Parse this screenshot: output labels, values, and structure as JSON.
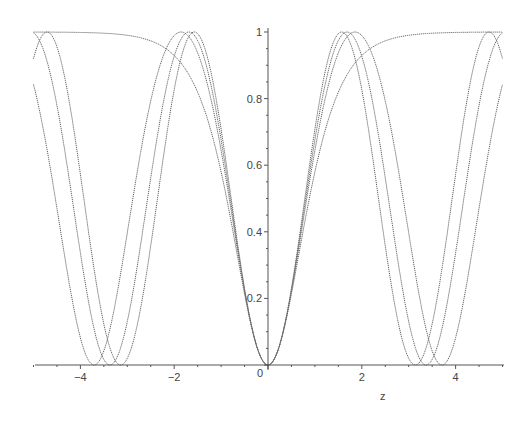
{
  "chart_data": {
    "type": "line",
    "title": "",
    "xlabel": "z",
    "ylabel": "",
    "xlim": [
      -5,
      5
    ],
    "ylim": [
      0,
      1
    ],
    "grid": false,
    "legend": null,
    "x_ticks": [
      -4,
      -2,
      0,
      2,
      4
    ],
    "x_tick_labels": [
      "-4",
      "-2",
      "0",
      "2",
      "4"
    ],
    "y_ticks": [
      0.2,
      0.4,
      0.6,
      0.8,
      1
    ],
    "y_tick_labels": [
      "0.2",
      "0.4",
      "0.6",
      "0.8",
      "1"
    ],
    "origin_label": "0",
    "line_color": "#666666",
    "line_style": "dotted",
    "series": [
      {
        "name": "sn^2(z, k=0) = sin^2(z)",
        "k": 0,
        "peak_z": 1.571,
        "zero_z": 3.142
      },
      {
        "name": "sn^2(z, k=0.5)",
        "k": 0.5,
        "peak_z": 1.686,
        "zero_z": 3.371
      },
      {
        "name": "sn^2(z, k=0.7071)",
        "k": 0.7071,
        "peak_z": 1.854,
        "zero_z": 3.708
      },
      {
        "name": "sn^2(z, k=1) = tanh^2(z)",
        "k": 1,
        "peak_z": null,
        "zero_z": 0
      }
    ],
    "sample_points": {
      "x": [
        -5,
        -4,
        -3,
        -2,
        -1,
        0,
        1,
        2,
        3,
        4,
        5
      ],
      "k0": [
        0.92,
        0.573,
        0.02,
        0.827,
        0.708,
        0,
        0.708,
        0.827,
        0.02,
        0.573,
        0.92
      ],
      "k1": [
        0.999,
        0.999,
        0.99,
        0.93,
        0.58,
        0,
        0.58,
        0.93,
        0.99,
        0.999,
        0.999
      ]
    }
  },
  "axes": {
    "x_label": "z"
  }
}
